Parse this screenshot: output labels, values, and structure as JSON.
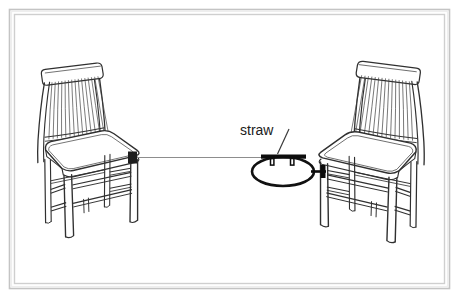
{
  "figure": {
    "title": "",
    "background_color": "#ffffff",
    "frame": {
      "outer_color": "#c9c9c9",
      "inner_color": "#d8d8d8",
      "shadow_color": "#e9e9e9"
    },
    "line_color": "#2b2b2b",
    "thread_color": "#8a8a8a",
    "straw_color": "#111111"
  },
  "annotations": {
    "straw_label": "straw",
    "leader_line": "straw-leader-line"
  },
  "objects": {
    "left_chair": {
      "name": "chair-left",
      "facing": "right",
      "back_slat_count": 15,
      "knot_label": ""
    },
    "right_chair": {
      "name": "chair-right",
      "facing": "left",
      "back_slat_count": 15,
      "knot_label": ""
    },
    "thread": {
      "name": "thread-line",
      "description": ""
    },
    "straw": {
      "name": "straw-bar",
      "tab_count": 2
    },
    "loop": {
      "name": "thread-loop-ellipse"
    }
  },
  "icons": {
    "frame": "picture-frame-border",
    "chair": "chair-icon",
    "straw": "straw-icon",
    "loop": "loop-icon"
  }
}
